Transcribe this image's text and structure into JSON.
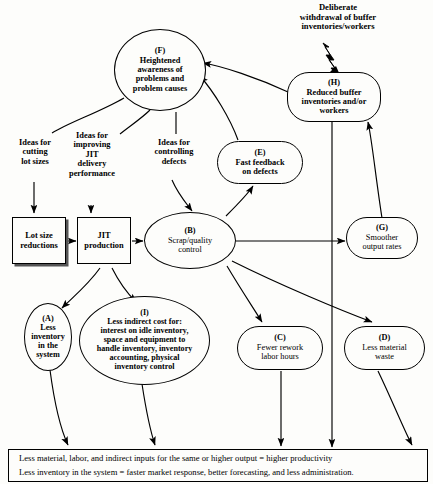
{
  "diagram": {
    "external_input": {
      "label": "Deliberate\nwithdrawal of buffer\ninventories/workers",
      "line1": "Deliberate",
      "line2": "withdrawal of buffer",
      "line3": "inventories/workers"
    },
    "edge_labels": [
      {
        "id": "ideas-cutting-lot-sizes",
        "line1": "Ideas for",
        "line2": "cutting",
        "line3": "lot sizes"
      },
      {
        "id": "ideas-improving-jit",
        "line1": "Ideas for",
        "line2": "improving",
        "line3": "JIT",
        "line4": "delivery",
        "line5": "performance"
      },
      {
        "id": "ideas-controlling-defects",
        "line1": "Ideas for",
        "line2": "controlling",
        "line3": "defects"
      }
    ],
    "nodes": [
      {
        "id": "F",
        "tag": "(F)",
        "label": "Heightened awareness of problems and problem causes",
        "lines": [
          "Heightened",
          "awareness of",
          "problems and",
          "problem causes"
        ],
        "shape": "ellipse"
      },
      {
        "id": "H",
        "tag": "(H)",
        "label": "Reduced buffer inventories and/or workers",
        "lines": [
          "Reduced buffer",
          "inventories and/or",
          "workers"
        ],
        "shape": "roundrect"
      },
      {
        "id": "E",
        "tag": "(E)",
        "label": "Fast feedback on defects",
        "lines": [
          "Fast feedback",
          "on defects"
        ],
        "shape": "roundrect"
      },
      {
        "id": "LOT",
        "tag": "",
        "label": "Lot size reductions",
        "lines": [
          "Lot size",
          "reductions"
        ],
        "shape": "shadowbox"
      },
      {
        "id": "JIT",
        "tag": "",
        "label": "JIT production",
        "lines": [
          "JIT",
          "production"
        ],
        "shape": "rect"
      },
      {
        "id": "B",
        "tag": "(B)",
        "label": "Scrap/quality control",
        "lines": [
          "Scrap/quality",
          "control"
        ],
        "shape": "ellipse"
      },
      {
        "id": "G",
        "tag": "(G)",
        "label": "Smoother output rates",
        "lines": [
          "Smoother",
          "output rates"
        ],
        "shape": "roundrect"
      },
      {
        "id": "A",
        "tag": "(A)",
        "label": "Less inventory in the system",
        "lines": [
          "Less",
          "inventory",
          "in the",
          "system"
        ],
        "shape": "ellipse"
      },
      {
        "id": "I",
        "tag": "(I)",
        "label": "Less indirect cost for: interest on idle inventory, space and equipment to handle inventory, inventory accounting, physical inventory control",
        "lines": [
          "Less indirect cost for:",
          "interest on idle inventory,",
          "space and equipment to",
          "handle inventory, inventory",
          "accounting, physical",
          "inventory control"
        ],
        "shape": "ellipse"
      },
      {
        "id": "C",
        "tag": "(C)",
        "label": "Fewer rework labor hours",
        "lines": [
          "Fewer rework",
          "labor hours"
        ],
        "shape": "roundrect"
      },
      {
        "id": "D",
        "tag": "(D)",
        "label": "Less material waste",
        "lines": [
          "Less material",
          "waste"
        ],
        "shape": "roundrect"
      }
    ],
    "summary": {
      "line1": "Less material, labor, and indirect inputs for the same or higher output = higher productivity",
      "line2": "Less inventory in the system = faster market response, better forecasting, and less administration."
    },
    "colors": {
      "stroke": "#000000",
      "background": "#fdfdfb",
      "shadow": "#555555"
    }
  }
}
